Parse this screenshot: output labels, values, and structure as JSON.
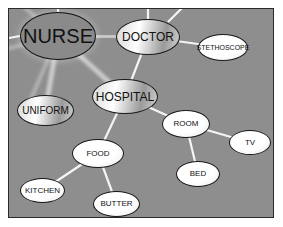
{
  "diagram": {
    "type": "concept-map",
    "colors": {
      "background": "#8e8e8e",
      "frame_border": "#2a2a2a",
      "edge": "#f4f4f4",
      "node_fill": "#ffffff",
      "node_border": "#1a1a1a"
    },
    "nodes": [
      {
        "id": "nurse",
        "label": "NURSE",
        "x": 20,
        "y": 12,
        "w": 76,
        "h": 48,
        "style": "dark",
        "font": 20
      },
      {
        "id": "doctor",
        "label": "DOCTOR",
        "x": 116,
        "y": 19,
        "w": 64,
        "h": 36,
        "style": "grad",
        "font": 12
      },
      {
        "id": "stethoscope",
        "label": "STETHOSCOPE",
        "x": 198,
        "y": 34,
        "w": 50,
        "h": 27,
        "style": "white",
        "font": 7
      },
      {
        "id": "hospital",
        "label": "HOSPITAL",
        "x": 92,
        "y": 79,
        "w": 66,
        "h": 35,
        "style": "grad",
        "font": 12
      },
      {
        "id": "uniform",
        "label": "UNIFORM",
        "x": 17,
        "y": 95,
        "w": 57,
        "h": 31,
        "style": "grad",
        "font": 10
      },
      {
        "id": "room",
        "label": "ROOM",
        "x": 162,
        "y": 110,
        "w": 48,
        "h": 28,
        "style": "white",
        "font": 8
      },
      {
        "id": "tv",
        "label": "TV",
        "x": 229,
        "y": 130,
        "w": 42,
        "h": 25,
        "style": "white",
        "font": 8
      },
      {
        "id": "food",
        "label": "FOOD",
        "x": 72,
        "y": 139,
        "w": 52,
        "h": 29,
        "style": "white",
        "font": 8
      },
      {
        "id": "bed",
        "label": "BED",
        "x": 176,
        "y": 161,
        "w": 44,
        "h": 26,
        "style": "white",
        "font": 8
      },
      {
        "id": "kitchen",
        "label": "KITCHEN",
        "x": 20,
        "y": 178,
        "w": 45,
        "h": 25,
        "style": "white",
        "font": 8
      },
      {
        "id": "butter",
        "label": "BUTTER",
        "x": 93,
        "y": 191,
        "w": 47,
        "h": 26,
        "style": "white",
        "font": 8
      }
    ],
    "edges": [
      {
        "from": "doctor",
        "to": "hospital"
      },
      {
        "from": "doctor",
        "to": "stethoscope"
      },
      {
        "from": "hospital",
        "to": "room"
      },
      {
        "from": "hospital",
        "to": "food"
      },
      {
        "from": "room",
        "to": "tv"
      },
      {
        "from": "room",
        "to": "bed"
      },
      {
        "from": "food",
        "to": "kitchen"
      },
      {
        "from": "food",
        "to": "butter"
      }
    ],
    "glow_edges": [
      {
        "from": "nurse",
        "to": "doctor"
      },
      {
        "from": "nurse",
        "to": "hospital"
      },
      {
        "from": "nurse",
        "to": "uniform"
      }
    ],
    "stub_edges": [
      {
        "x1": 148,
        "y1": 19,
        "x2": 148,
        "y2": 8
      },
      {
        "x1": 168,
        "y1": 22,
        "x2": 182,
        "y2": 8
      },
      {
        "x1": 58,
        "y1": 12,
        "x2": 58,
        "y2": 8
      },
      {
        "x1": 20,
        "y1": 36,
        "x2": 9,
        "y2": 38
      }
    ]
  }
}
